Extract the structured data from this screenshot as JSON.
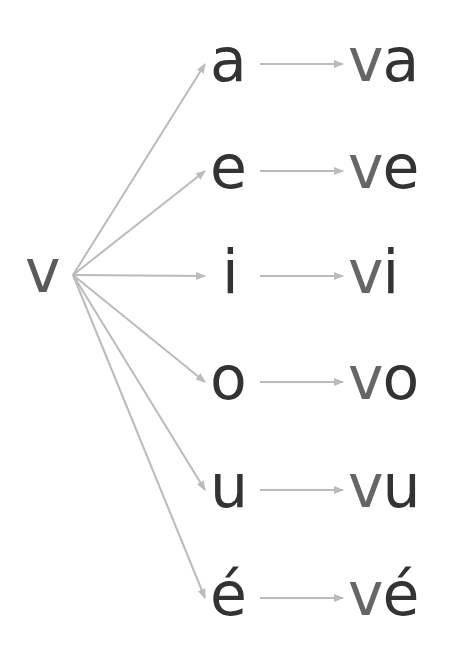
{
  "diagram": {
    "root": {
      "label": "v",
      "x": 25,
      "y": 245
    },
    "fan_origin": {
      "x": 73,
      "y": 275
    },
    "colors": {
      "arrow": "#bbbbbb",
      "root": "#5a5a5a",
      "vowel": "#333333",
      "consonant": "#666666"
    },
    "rows": [
      {
        "vowel": "a",
        "syllable_consonant": "v",
        "syllable_vowel": "a",
        "y": 64
      },
      {
        "vowel": "e",
        "syllable_consonant": "v",
        "syllable_vowel": "e",
        "y": 171
      },
      {
        "vowel": "i",
        "syllable_consonant": "v",
        "syllable_vowel": "i",
        "y": 276
      },
      {
        "vowel": "o",
        "syllable_consonant": "v",
        "syllable_vowel": "o",
        "y": 382
      },
      {
        "vowel": "u",
        "syllable_consonant": "v",
        "syllable_vowel": "u",
        "y": 490
      },
      {
        "vowel": "é",
        "syllable_consonant": "v",
        "syllable_vowel": "é",
        "y": 598
      }
    ]
  }
}
